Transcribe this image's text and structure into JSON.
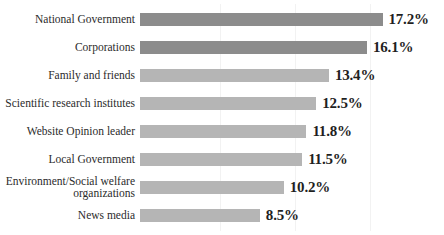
{
  "chart_data": {
    "type": "bar",
    "orientation": "horizontal",
    "title": "",
    "xlabel": "",
    "ylabel": "",
    "grid": true,
    "legend": "none",
    "xlim": [
      0,
      20
    ],
    "value_suffix": "%",
    "categories": [
      "National Government",
      "Corporations",
      "Family and friends",
      "Scientific research institutes",
      "Website Opinion leader",
      "Local Government",
      "Environment/Social welfare\norganizations",
      "News media"
    ],
    "values": [
      17.2,
      16.1,
      13.4,
      12.5,
      11.8,
      11.5,
      10.2,
      8.5
    ],
    "value_labels": [
      "17.2%",
      "16.1%",
      "13.4%",
      "12.5%",
      "11.8%",
      "11.5%",
      "10.2%",
      "8.5%"
    ],
    "bar_colors": [
      "#8c8c8c",
      "#8c8c8c",
      "#b5b5b5",
      "#b5b5b5",
      "#b5b5b5",
      "#b5b5b5",
      "#b5b5b5",
      "#b5b5b5"
    ],
    "colors": {
      "bar_dark": "#8c8c8c",
      "bar_light": "#b5b5b5",
      "text": "#2b2b2b",
      "value_text": "#1f1f1f",
      "gridline": "#f2f2f2",
      "background": "#ffffff"
    }
  },
  "chart": {
    "title_cropped": "",
    "gridline_positions": [
      75,
      150,
      225
    ]
  }
}
